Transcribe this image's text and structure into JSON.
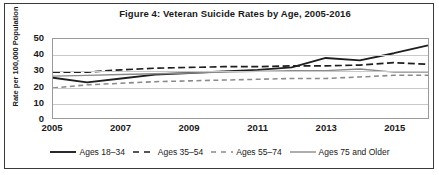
{
  "figure": {
    "title": "Figure 4: Veteran Suicide Rates by Age, 2005-2016"
  },
  "chart_data": {
    "type": "line",
    "title": "Figure 4: Veteran Suicide Rates by Age, 2005-2016",
    "xlabel": "",
    "ylabel": "Rate per 100,000 Population",
    "xlim": [
      2005,
      2016
    ],
    "ylim": [
      0,
      50
    ],
    "yticks": [
      0,
      10,
      20,
      30,
      40,
      50
    ],
    "xticks": [
      2005,
      2007,
      2009,
      2011,
      2013,
      2015
    ],
    "x": [
      2005,
      2006,
      2007,
      2008,
      2009,
      2010,
      2011,
      2012,
      2013,
      2014,
      2015,
      2016
    ],
    "grid": "horizontal",
    "legend_position": "bottom",
    "series": [
      {
        "name": "Ages 18-34",
        "style": "solid",
        "color": "#1f1f1f",
        "width": 1.9,
        "values": [
          25.5,
          22.5,
          25.0,
          27.5,
          28.5,
          29.5,
          30.5,
          32.0,
          38.0,
          36.5,
          41.0,
          46.0
        ]
      },
      {
        "name": "Ages 35-54",
        "style": "longdash",
        "color": "#1f1f1f",
        "width": 1.7,
        "values": [
          29.0,
          29.0,
          30.5,
          31.5,
          32.0,
          32.5,
          32.5,
          33.0,
          33.0,
          33.5,
          35.0,
          34.0
        ]
      },
      {
        "name": "Ages 55-74",
        "style": "dash",
        "color": "#8a8a8a",
        "width": 1.6,
        "values": [
          19.0,
          21.0,
          22.0,
          23.0,
          23.5,
          24.0,
          24.5,
          25.0,
          25.0,
          26.0,
          27.0,
          27.0
        ]
      },
      {
        "name": "Ages 75 and Older",
        "style": "solid",
        "color": "#8a8a8a",
        "width": 1.4,
        "values": [
          26.5,
          27.0,
          27.5,
          28.0,
          28.5,
          29.0,
          29.5,
          30.0,
          30.0,
          31.0,
          29.0,
          29.0
        ]
      }
    ]
  },
  "legend": {
    "items": [
      {
        "label": "Ages 18–34"
      },
      {
        "label": "Ages 35–54"
      },
      {
        "label": "Ages 55–74"
      },
      {
        "label": "Ages 75 and Older"
      }
    ]
  }
}
